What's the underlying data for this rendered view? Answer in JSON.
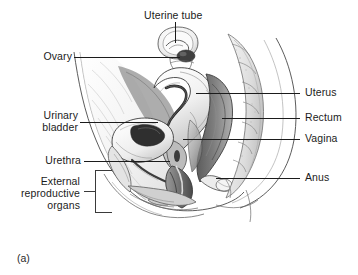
{
  "figure": {
    "caption": "(a)",
    "type": "anatomical-illustration",
    "style": "grayscale pen-and-ink medical illustration"
  },
  "colors": {
    "text": "#1b1b1b",
    "leader_line": "#1b1b1b",
    "background": "#ffffff",
    "ink_dark": "#3a3a3a",
    "ink_mid": "#8a8a8a",
    "ink_light": "#cfcfcf"
  },
  "labels": {
    "uterine_tube": "Uterine tube",
    "ovary": "Ovary",
    "urinary_bladder_line1": "Urinary",
    "urinary_bladder_line2": "bladder",
    "urethra": "Urethra",
    "external_line1": "External",
    "external_line2": "reproductive",
    "external_line3": "organs",
    "uterus": "Uterus",
    "rectum": "Rectum",
    "vagina": "Vagina",
    "anus": "Anus"
  },
  "callouts": [
    {
      "id": "uterine-tube",
      "text": "Uterine tube",
      "side": "top"
    },
    {
      "id": "ovary",
      "text": "Ovary",
      "side": "left"
    },
    {
      "id": "urinary-bladder",
      "text": "Urinary bladder",
      "side": "left"
    },
    {
      "id": "urethra",
      "text": "Urethra",
      "side": "left"
    },
    {
      "id": "external-reproductive-organs",
      "text": "External reproductive organs",
      "side": "left",
      "connector": "bracket"
    },
    {
      "id": "uterus",
      "text": "Uterus",
      "side": "right"
    },
    {
      "id": "rectum",
      "text": "Rectum",
      "side": "right"
    },
    {
      "id": "vagina",
      "text": "Vagina",
      "side": "right"
    },
    {
      "id": "anus",
      "text": "Anus",
      "side": "right"
    }
  ]
}
